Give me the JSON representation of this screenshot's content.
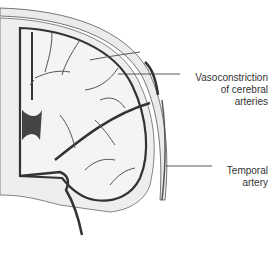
{
  "figure": {
    "labels": [
      {
        "id": "vasoconstriction",
        "lines": [
          "Vasoconstriction",
          "of cerebral",
          "arteries"
        ]
      },
      {
        "id": "temporal",
        "lines": [
          "Temporal",
          "artery"
        ]
      }
    ]
  },
  "colors": {
    "background": "#ffffff",
    "outline": "#333333",
    "brain_fill": "#f2f2f2",
    "skull_fill": "#ebebeb",
    "vessel": "#3a3a3a"
  }
}
